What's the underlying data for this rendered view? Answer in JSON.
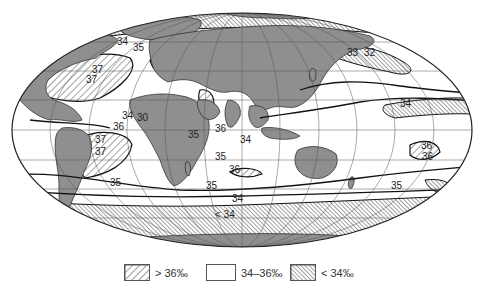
{
  "map": {
    "projection": "Mollweide world projection",
    "subject": "Sea surface salinity (‰)",
    "colors": {
      "land": "#8f8f8f",
      "ocean": "#ffffff",
      "hatch_line": "#444444",
      "isoline": "#111111",
      "graticule": "#555555"
    },
    "isohaline_labels": [
      {
        "id": "na-34",
        "text": "34",
        "x": 117,
        "y": 45
      },
      {
        "id": "na-35",
        "text": "35",
        "x": 133,
        "y": 51
      },
      {
        "id": "na-37a",
        "text": "37",
        "x": 92,
        "y": 73
      },
      {
        "id": "na-37b",
        "text": "37",
        "x": 86,
        "y": 83
      },
      {
        "id": "med-34",
        "text": "34",
        "x": 122,
        "y": 119
      },
      {
        "id": "med-30",
        "text": "30",
        "x": 137,
        "y": 121
      },
      {
        "id": "eatl-36",
        "text": "36",
        "x": 113,
        "y": 130
      },
      {
        "id": "satl-37a",
        "text": "37",
        "x": 95,
        "y": 143
      },
      {
        "id": "satl-37b",
        "text": "37",
        "x": 95,
        "y": 155
      },
      {
        "id": "sw-35",
        "text": "35",
        "x": 188,
        "y": 138
      },
      {
        "id": "arab-36",
        "text": "36",
        "x": 215,
        "y": 132
      },
      {
        "id": "bengal-34",
        "text": "34",
        "x": 240,
        "y": 143
      },
      {
        "id": "io-35",
        "text": "35",
        "x": 215,
        "y": 160
      },
      {
        "id": "sio-36",
        "text": "36",
        "x": 229,
        "y": 173
      },
      {
        "id": "so-35",
        "text": "35",
        "x": 110,
        "y": 186
      },
      {
        "id": "sio-35b",
        "text": "35",
        "x": 206,
        "y": 189
      },
      {
        "id": "so-34",
        "text": "34",
        "x": 232,
        "y": 202
      },
      {
        "id": "so-lt34",
        "text": "< 34",
        "x": 215,
        "y": 218
      },
      {
        "id": "np-33",
        "text": "33",
        "x": 347,
        "y": 56
      },
      {
        "id": "np-32",
        "text": "32",
        "x": 364,
        "y": 56
      },
      {
        "id": "npac-34",
        "text": "34",
        "x": 400,
        "y": 107
      },
      {
        "id": "ind-34",
        "text": "34",
        "x": 245,
        "y": 142
      },
      {
        "id": "sp-36a",
        "text": "36",
        "x": 421,
        "y": 149
      },
      {
        "id": "sp-36b",
        "text": "36",
        "x": 422,
        "y": 160
      },
      {
        "id": "sp-35",
        "text": "35",
        "x": 391,
        "y": 189
      }
    ]
  },
  "legend": {
    "items": [
      {
        "label": "> 36‰",
        "pattern": "hatch-sparse"
      },
      {
        "label": "34–36‰",
        "pattern": "plain"
      },
      {
        "label": "< 34‰",
        "pattern": "hatch-dense"
      }
    ]
  }
}
